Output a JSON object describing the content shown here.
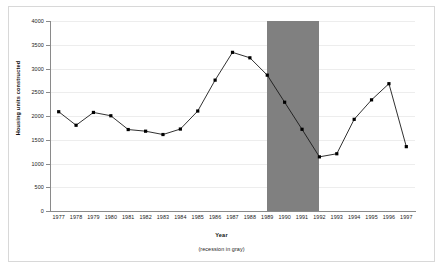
{
  "chart_data": {
    "type": "line",
    "title": "",
    "xlabel": "Year",
    "ylabel": "Housing units constructed",
    "caption": "(recession in gray)",
    "categories": [
      1977,
      1978,
      1979,
      1980,
      1981,
      1982,
      1983,
      1984,
      1985,
      1986,
      1987,
      1988,
      1989,
      1990,
      1991,
      1992,
      1993,
      1994,
      1995,
      1996,
      1997
    ],
    "values": [
      2090,
      1805,
      2075,
      2005,
      1715,
      1680,
      1610,
      1725,
      2105,
      2755,
      3340,
      3225,
      2860,
      2290,
      1720,
      1140,
      1205,
      1930,
      2340,
      2680,
      1355
    ],
    "series": [
      {
        "name": "Housing units constructed",
        "values": [
          2090,
          1805,
          2075,
          2005,
          1715,
          1680,
          1610,
          1725,
          2105,
          2755,
          3340,
          3225,
          2860,
          2290,
          1720,
          1140,
          1205,
          1930,
          2340,
          2680,
          1355
        ]
      }
    ],
    "xlim": [
      1976.5,
      1997.5
    ],
    "ylim": [
      0,
      4000
    ],
    "ytick_labels": [
      "0",
      "500",
      "1000",
      "1500",
      "2000",
      "2500",
      "3000",
      "3500",
      "4000"
    ],
    "ytick_values": [
      0,
      500,
      1000,
      1500,
      2000,
      2500,
      3000,
      3500,
      4000
    ],
    "xtick_labels": [
      "1977",
      "1978",
      "1979",
      "1980",
      "1981",
      "1982",
      "1983",
      "1984",
      "1985",
      "1986",
      "1987",
      "1988",
      "1989",
      "1990",
      "1991",
      "1992",
      "1993",
      "1994",
      "1995",
      "1996",
      "1997"
    ],
    "grid": true,
    "legend": "none",
    "marker": "square",
    "line_color": "#1a1a1a",
    "marker_color": "#000000",
    "grid_color": "#ededed",
    "axis_color": "#8a8a8a",
    "annotations": [
      {
        "type": "shaded-band",
        "label": "recession",
        "color": "#808080",
        "x_start": 1989,
        "x_end": 1992,
        "y_start": 0,
        "y_end": 4000
      }
    ]
  }
}
